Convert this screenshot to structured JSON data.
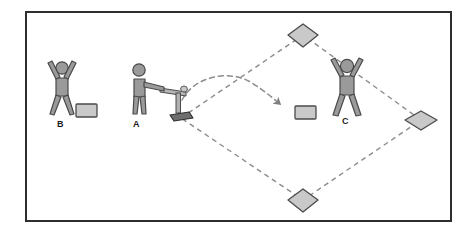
{
  "figure": {
    "kind": "diagram",
    "caption_labels": [
      "B",
      "A",
      "C"
    ]
  },
  "colors": {
    "frame_stroke": "#2e2e2e",
    "background": "#ffffff",
    "person_fill": "#9a9a9a",
    "person_stroke": "#4a4a4a",
    "base_fill": "#c9c9c9",
    "base_stroke": "#4a4a4a",
    "glove_fill": "#c9c9c9",
    "glove_stroke": "#3f3f3f",
    "tee_fill": "#b5b5b5",
    "tee_stroke": "#4a4a4a",
    "plate_fill": "#6f6f6f",
    "plate_stroke": "#2e2e2e",
    "dash_stroke": "#8c8c8c",
    "arrow_stroke": "#8c8c8c",
    "label_text": "#1d1d1d"
  },
  "players": [
    {
      "id": "player-b",
      "label": "B",
      "pose": "arms-raised",
      "x": 62,
      "y": 90
    },
    {
      "id": "player-a",
      "label": "A",
      "pose": "batting-stance",
      "x": 137,
      "y": 90
    },
    {
      "id": "player-c",
      "label": "C",
      "pose": "arms-raised",
      "x": 347,
      "y": 88
    }
  ],
  "bases": [
    {
      "id": "base-second",
      "name": "second-base",
      "x": 303,
      "y": 35
    },
    {
      "id": "base-first",
      "name": "first-base",
      "x": 421,
      "y": 120
    },
    {
      "id": "base-third",
      "name": "third-base",
      "x": 303,
      "y": 200
    },
    {
      "id": "base-home",
      "name": "home-plate",
      "x": 181,
      "y": 118
    }
  ],
  "equipment": [
    {
      "id": "glove-b",
      "name": "glove-near-b",
      "x": 82,
      "y": 108
    },
    {
      "id": "glove-c",
      "name": "glove-near-c",
      "x": 305,
      "y": 113
    },
    {
      "id": "batting-tee",
      "name": "batting-tee",
      "x": 178,
      "y": 95
    }
  ],
  "ball_path": {
    "name": "ball-trajectory",
    "style": "dashed-curve-with-arrowhead",
    "start_x": 182,
    "start_y": 100,
    "end_x": 281,
    "end_y": 103
  },
  "diamond_path": {
    "name": "base-path",
    "style": "dashed"
  }
}
